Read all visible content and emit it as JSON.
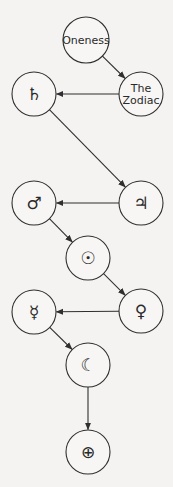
{
  "diagram": {
    "nodes": [
      {
        "id": "oneness",
        "label": [
          "Oneness"
        ],
        "kind": "text"
      },
      {
        "id": "zodiac",
        "label": [
          "The",
          "Zodiac"
        ],
        "kind": "text"
      },
      {
        "id": "saturn",
        "label": [
          "♄"
        ],
        "kind": "symbol"
      },
      {
        "id": "jupiter",
        "label": [
          "♃"
        ],
        "kind": "symbol"
      },
      {
        "id": "mars",
        "label": [
          "♂"
        ],
        "kind": "symbol"
      },
      {
        "id": "sun",
        "label": [
          "☉"
        ],
        "kind": "symbol"
      },
      {
        "id": "venus",
        "label": [
          "♀"
        ],
        "kind": "symbol"
      },
      {
        "id": "mercury",
        "label": [
          "☿"
        ],
        "kind": "symbol"
      },
      {
        "id": "moon",
        "label": [
          "☾"
        ],
        "kind": "symbol"
      },
      {
        "id": "earth",
        "label": [
          "⊕"
        ],
        "kind": "symbol"
      }
    ],
    "edges": [
      {
        "from": "oneness",
        "to": "zodiac"
      },
      {
        "from": "zodiac",
        "to": "saturn"
      },
      {
        "from": "saturn",
        "to": "jupiter"
      },
      {
        "from": "jupiter",
        "to": "mars"
      },
      {
        "from": "mars",
        "to": "sun"
      },
      {
        "from": "sun",
        "to": "venus"
      },
      {
        "from": "venus",
        "to": "mercury"
      },
      {
        "from": "mercury",
        "to": "moon"
      },
      {
        "from": "moon",
        "to": "earth"
      }
    ]
  }
}
